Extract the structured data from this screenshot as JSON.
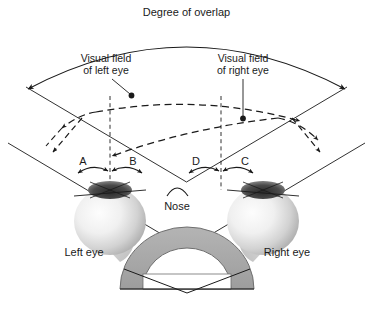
{
  "figure": {
    "title": "Degree of overlap",
    "background_color": "#ffffff",
    "line_color": "#1a1a1a",
    "dome_fill": "#a8a8a8",
    "dome_inner_fill": "#ffffff",
    "eye_fill": "#e8e8e8",
    "cornea_fill": "#3a3a3a"
  },
  "labels": {
    "degree_of_overlap": "Degree of overlap",
    "visual_field_left_line1": "Visual field",
    "visual_field_left_line2": "of left eye",
    "visual_field_right_line1": "Visual field",
    "visual_field_right_line2": "of right eye",
    "nose": "Nose",
    "left_eye": "Left eye",
    "right_eye": "Right eye"
  },
  "zones": [
    {
      "id": "A",
      "label": "A",
      "side": "left",
      "position": "temporal"
    },
    {
      "id": "B",
      "label": "B",
      "side": "left",
      "position": "nasal"
    },
    {
      "id": "D",
      "label": "D",
      "side": "right",
      "position": "nasal"
    },
    {
      "id": "C",
      "label": "C",
      "side": "right",
      "position": "temporal"
    }
  ]
}
